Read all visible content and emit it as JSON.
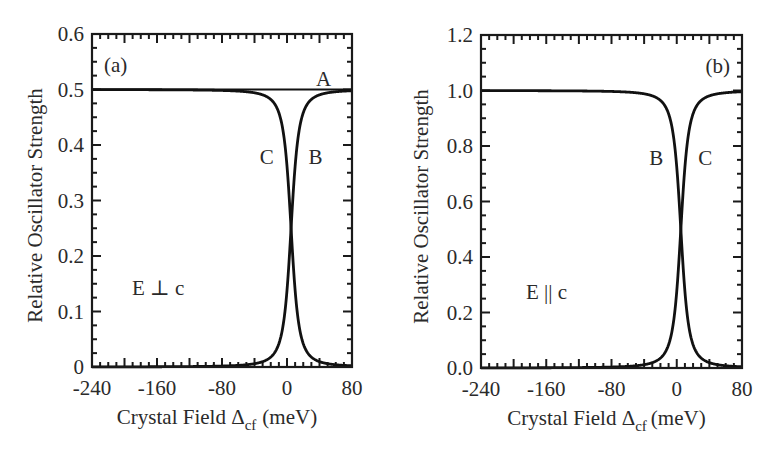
{
  "chart_data": [
    {
      "type": "line",
      "panel_label": "(a)",
      "annotation": "E ⊥ c",
      "xlabel": "Crystal Field Δcf (meV)",
      "xlabel_main": "Crystal Field Δ",
      "xlabel_sub": "cf",
      "xlabel_unit": "(meV)",
      "ylabel": "Relative Oscillator Strength",
      "xlim": [
        -240,
        80
      ],
      "ylim": [
        0,
        0.6
      ],
      "xticks": [
        -240,
        -160,
        -80,
        0,
        80
      ],
      "xtick_labels": [
        "-240",
        "-160",
        "-80",
        "0",
        "80"
      ],
      "yticks": [
        0,
        0.1,
        0.2,
        0.3,
        0.4,
        0.5,
        0.6
      ],
      "ytick_labels": [
        "0",
        "0.1",
        "0.2",
        "0.3",
        "0.4",
        "0.5",
        "0.6"
      ],
      "grid": false,
      "crossing_x": 5,
      "width_param": 10,
      "series": [
        {
          "name": "A",
          "x": [
            -240,
            -160,
            -80,
            -40,
            0,
            5,
            10,
            40,
            80
          ],
          "values": [
            0.5,
            0.5,
            0.5,
            0.5,
            0.5,
            0.5,
            0.5,
            0.5,
            0.5
          ]
        },
        {
          "name": "B",
          "x": [
            -240,
            -160,
            -80,
            -40,
            -20,
            -10,
            0,
            5,
            10,
            20,
            40,
            80
          ],
          "values": [
            0.5,
            0.499,
            0.497,
            0.488,
            0.465,
            0.43,
            0.33,
            0.25,
            0.17,
            0.07,
            0.025,
            0.009
          ]
        },
        {
          "name": "C",
          "x": [
            -240,
            -160,
            -80,
            -40,
            -20,
            -10,
            0,
            5,
            10,
            20,
            40,
            80
          ],
          "values": [
            0.0,
            0.001,
            0.003,
            0.012,
            0.035,
            0.07,
            0.17,
            0.25,
            0.33,
            0.43,
            0.475,
            0.491
          ]
        }
      ],
      "curve_labels": [
        {
          "text": "A",
          "x": 45,
          "y": 0.52
        },
        {
          "text": "C",
          "x": -25,
          "y": 0.38
        },
        {
          "text": "B",
          "x": 35,
          "y": 0.38
        }
      ]
    },
    {
      "type": "line",
      "panel_label": "(b)",
      "annotation": "E || c",
      "xlabel": "Crystal Field Δcf (meV)",
      "xlabel_main": "Crystal Field Δ",
      "xlabel_sub": "cf",
      "xlabel_unit": "(meV)",
      "ylabel": "Relative Oscillator Strength",
      "xlim": [
        -240,
        80
      ],
      "ylim": [
        0,
        1.2
      ],
      "xticks": [
        -240,
        -160,
        -80,
        0,
        80
      ],
      "xtick_labels": [
        "-240",
        "-160",
        "-80",
        "0",
        "80"
      ],
      "yticks": [
        0,
        0.2,
        0.4,
        0.6,
        0.8,
        1.0,
        1.2
      ],
      "ytick_labels": [
        "0.0",
        "0.2",
        "0.4",
        "0.6",
        "0.8",
        "1.0",
        "1.2"
      ],
      "grid": false,
      "crossing_x": 5,
      "width_param": 10,
      "series": [
        {
          "name": "B",
          "x": [
            -240,
            -160,
            -80,
            -40,
            -20,
            -10,
            0,
            5,
            10,
            20,
            40,
            80
          ],
          "values": [
            1.0,
            0.998,
            0.994,
            0.976,
            0.93,
            0.86,
            0.67,
            0.5,
            0.33,
            0.14,
            0.05,
            0.018
          ]
        },
        {
          "name": "C",
          "x": [
            -240,
            -160,
            -80,
            -40,
            -20,
            -10,
            0,
            5,
            10,
            20,
            40,
            80
          ],
          "values": [
            0.0,
            0.002,
            0.006,
            0.024,
            0.07,
            0.14,
            0.33,
            0.5,
            0.67,
            0.86,
            0.95,
            0.982
          ]
        }
      ],
      "curve_labels": [
        {
          "text": "B",
          "x": -25,
          "y": 0.76
        },
        {
          "text": "C",
          "x": 35,
          "y": 0.76
        }
      ]
    }
  ]
}
